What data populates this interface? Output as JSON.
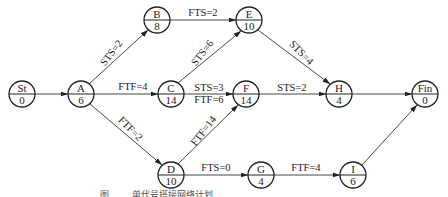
{
  "diagram": {
    "type": "precedence-network",
    "nodes": [
      {
        "id": "St",
        "name": "St",
        "duration": "0",
        "x": 22,
        "y": 94
      },
      {
        "id": "A",
        "name": "A",
        "duration": "6",
        "x": 81,
        "y": 94
      },
      {
        "id": "B",
        "name": "B",
        "duration": "8",
        "x": 157,
        "y": 20
      },
      {
        "id": "C",
        "name": "C",
        "duration": "14",
        "x": 171,
        "y": 94
      },
      {
        "id": "D",
        "name": "D",
        "duration": "10",
        "x": 171,
        "y": 175
      },
      {
        "id": "E",
        "name": "E",
        "duration": "10",
        "x": 249,
        "y": 20
      },
      {
        "id": "F",
        "name": "F",
        "duration": "14",
        "x": 246,
        "y": 94
      },
      {
        "id": "G",
        "name": "G",
        "duration": "4",
        "x": 261,
        "y": 175
      },
      {
        "id": "H",
        "name": "H",
        "duration": "4",
        "x": 339,
        "y": 94
      },
      {
        "id": "I",
        "name": "I",
        "duration": "6",
        "x": 353,
        "y": 175
      },
      {
        "id": "Fin",
        "name": "Fin",
        "duration": "0",
        "x": 425,
        "y": 94
      }
    ],
    "edges": [
      {
        "from": "St",
        "to": "A",
        "label": ""
      },
      {
        "from": "A",
        "to": "B",
        "label": "STS=2"
      },
      {
        "from": "A",
        "to": "C",
        "label": "FTF=4"
      },
      {
        "from": "A",
        "to": "D",
        "label": "FTF=2"
      },
      {
        "from": "B",
        "to": "E",
        "label": "FTS=2"
      },
      {
        "from": "C",
        "to": "E",
        "label": "STS=6"
      },
      {
        "from": "C",
        "to": "F",
        "label": "STS=3",
        "label2": "FTF=6"
      },
      {
        "from": "D",
        "to": "F",
        "label": "FTF=14"
      },
      {
        "from": "D",
        "to": "G",
        "label": "FTS=0"
      },
      {
        "from": "E",
        "to": "H",
        "label": "STS=4"
      },
      {
        "from": "F",
        "to": "H",
        "label": "STS=2"
      },
      {
        "from": "G",
        "to": "I",
        "label": "FTF=4"
      },
      {
        "from": "H",
        "to": "Fin",
        "label": ""
      },
      {
        "from": "I",
        "to": "Fin",
        "label": ""
      }
    ],
    "caption": "图 …… 单代号搭接网络计划"
  }
}
